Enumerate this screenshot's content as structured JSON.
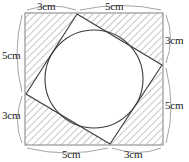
{
  "figure": {
    "unit": "cm",
    "colors": {
      "stroke": "#3a3a3a",
      "outer_square_stroke": "#8a8a8a",
      "bracket_stroke": "#9a9a9a",
      "hatch": "#6e6e6e",
      "background": "#ffffff",
      "text": "#1a1a1a"
    },
    "outer_square": {
      "name": "outer-square",
      "x": 25,
      "y": 13,
      "width": 138,
      "height": 132,
      "side_length_cm": 8
    },
    "tilted_square": {
      "name": "tilted-square",
      "vertices": [
        {
          "label": "top",
          "x": 77,
          "y": 14
        },
        {
          "label": "right",
          "x": 162,
          "y": 65
        },
        {
          "label": "bottom",
          "x": 110,
          "y": 144
        },
        {
          "label": "left",
          "x": 26,
          "y": 94
        }
      ],
      "side_length_cm": 5.83
    },
    "inscribed_circle": {
      "name": "inscribed-circle",
      "cx": 94,
      "cy": 79,
      "r": 49
    },
    "hatched_regions": [
      {
        "name": "corner-triangle-top-left",
        "points": "25,13 77,14 26,94"
      },
      {
        "name": "corner-triangle-top-right",
        "points": "163,13 162,65 77,14"
      },
      {
        "name": "corner-triangle-bottom-right",
        "points": "163,145 110,144 162,65"
      },
      {
        "name": "corner-triangle-bottom-left",
        "points": "25,145 26,94 110,144"
      }
    ],
    "labels": [
      {
        "name": "label-top-left",
        "text": "3cm",
        "edge": "top",
        "segment": 1,
        "x": 37,
        "y": 1,
        "value": 3
      },
      {
        "name": "label-top-right",
        "text": "5cm",
        "edge": "top",
        "segment": 2,
        "x": 105,
        "y": 1,
        "value": 5
      },
      {
        "name": "label-right-top",
        "text": "3cm",
        "edge": "right",
        "segment": 1,
        "x": 165,
        "y": 35,
        "value": 3
      },
      {
        "name": "label-right-bottom",
        "text": "5cm",
        "edge": "right",
        "segment": 2,
        "x": 165,
        "y": 100,
        "value": 5
      },
      {
        "name": "label-bottom-left",
        "text": "5cm",
        "edge": "bottom",
        "segment": 1,
        "x": 62,
        "y": 149,
        "value": 5
      },
      {
        "name": "label-bottom-right",
        "text": "3cm",
        "edge": "bottom",
        "segment": 2,
        "x": 124,
        "y": 149,
        "value": 3
      },
      {
        "name": "label-left-top",
        "text": "5cm",
        "edge": "left",
        "segment": 1,
        "x": 2,
        "y": 50,
        "value": 5
      },
      {
        "name": "label-left-bottom",
        "text": "3cm",
        "edge": "left",
        "segment": 2,
        "x": 2,
        "y": 110,
        "value": 3
      }
    ],
    "brackets": [
      {
        "name": "bracket-top-left",
        "d": "M 27 10 Q 52 2 76 10"
      },
      {
        "name": "bracket-top-right",
        "d": "M 80 10 Q 122 1 161 10"
      },
      {
        "name": "bracket-right-top",
        "d": "M 166 15 Q 175 38 166 63"
      },
      {
        "name": "bracket-right-bottom",
        "d": "M 166 68 Q 176 108 166 143"
      },
      {
        "name": "bracket-bottom-left",
        "d": "M 27 148 Q 68 158 108 148"
      },
      {
        "name": "bracket-bottom-right",
        "d": "M 112 148 Q 139 157 161 148"
      },
      {
        "name": "bracket-left-top",
        "d": "M 22 15 Q 12 54 22 92"
      },
      {
        "name": "bracket-left-bottom",
        "d": "M 22 96 Q 13 122 22 143"
      }
    ]
  }
}
